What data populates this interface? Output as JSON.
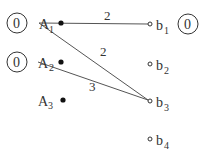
{
  "diagram": {
    "type": "bipartite-graph",
    "left_nodes": [
      {
        "id": "A1",
        "label": "A",
        "sub": "1",
        "x": 39,
        "y": 23,
        "marker": "filled",
        "circle_value": "0"
      },
      {
        "id": "A2",
        "label": "A",
        "sub": "2",
        "x": 38,
        "y": 62,
        "marker": "filled",
        "circle_value": "0"
      },
      {
        "id": "A3",
        "label": "A",
        "sub": "3",
        "x": 36,
        "y": 100,
        "marker": "filled",
        "circle_value": null
      }
    ],
    "right_nodes": [
      {
        "id": "b1",
        "label": "b",
        "sub": "1",
        "x": 150,
        "y": 24,
        "marker": "open",
        "circle_value": "0"
      },
      {
        "id": "b2",
        "label": "b",
        "sub": "2",
        "x": 150,
        "y": 64,
        "marker": "open",
        "circle_value": null
      },
      {
        "id": "b3",
        "label": "b",
        "sub": "3",
        "x": 150,
        "y": 101,
        "marker": "open",
        "circle_value": null
      },
      {
        "id": "b4",
        "label": "b",
        "sub": "4",
        "x": 150,
        "y": 139,
        "marker": "open",
        "circle_value": null
      }
    ],
    "edges": [
      {
        "from": "A1",
        "to": "b1",
        "weight": "2",
        "label_x": 107,
        "label_y": 19
      },
      {
        "from": "A1",
        "to": "b3",
        "weight": "2",
        "label_x": 104,
        "label_y": 55
      },
      {
        "from": "A2",
        "to": "b3",
        "weight": "3",
        "label_x": 93,
        "label_y": 91
      }
    ],
    "colors": {
      "line": "#444444",
      "text": "#333333",
      "background": "#ffffff"
    }
  }
}
